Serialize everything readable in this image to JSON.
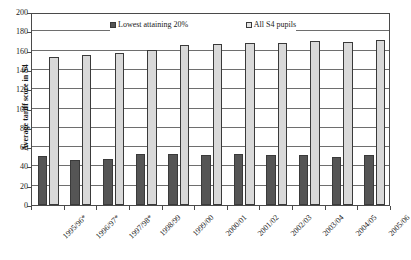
{
  "top_strip": {
    "text": " "
  },
  "chart_data": {
    "type": "bar",
    "title": "",
    "xlabel": "",
    "ylabel": "Average tariff score in S4",
    "ylim": [
      0,
      200
    ],
    "ytick_step": 20,
    "yticks": [
      200,
      180,
      160,
      140,
      120,
      100,
      80,
      60,
      40,
      20,
      0
    ],
    "grid": true,
    "legend_position": "top-inside",
    "categories": [
      "1995/96*",
      "1996/97*",
      "1997/98*",
      "1998/99",
      "1999/00",
      "2000/01",
      "2001/02",
      "2002/03",
      "2003/04",
      "2004/05",
      "2005/06"
    ],
    "series": [
      {
        "name": "Lowest attaining 20%",
        "color": "#555555",
        "values": [
          51,
          47,
          48,
          53,
          53,
          52,
          53,
          52,
          52,
          50,
          52
        ]
      },
      {
        "name": "All S4 pupils",
        "color": "#d9d9d9",
        "values": [
          153,
          155,
          158,
          161,
          166,
          167,
          168,
          168,
          170,
          169,
          171
        ]
      }
    ]
  },
  "legend": {
    "entries": [
      {
        "label": "Lowest attaining 20%",
        "swatch": "low"
      },
      {
        "label": "All S4 pupils",
        "swatch": "all"
      }
    ]
  },
  "colors": {
    "lowest_attaining": "#555555",
    "all_pupils": "#d9d9d9",
    "axis": "#4a4a4a",
    "grid": "#6e6e6e",
    "background": "#ffffff"
  }
}
